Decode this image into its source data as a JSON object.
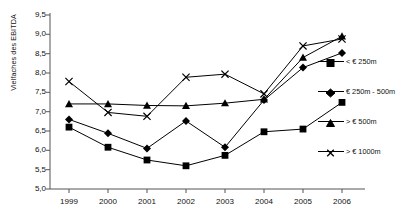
{
  "axis": {
    "ylabel": "Vielfaches des EBITDA",
    "yticks": [
      "9,5",
      "9,0",
      "8,5",
      "8,0",
      "7,5",
      "7,0",
      "6,5",
      "6,0",
      "5,5",
      "5,0"
    ],
    "xticks": [
      "1999",
      "2000",
      "2001",
      "2002",
      "2003",
      "2004",
      "2005",
      "2006"
    ]
  },
  "legend": {
    "items": [
      {
        "label": "< € 250m",
        "marker": "square-marker"
      },
      {
        "label": "€ 250m - 500m",
        "marker": "diamond-marker"
      },
      {
        "label": "> € 500m",
        "marker": "triangle-marker"
      },
      {
        "label": "> € 1000m",
        "marker": "x-marker"
      }
    ]
  },
  "chart_data": {
    "type": "line",
    "title": "",
    "xlabel": "",
    "ylabel": "Vielfaches des EBITDA",
    "categories": [
      "1999",
      "2000",
      "2001",
      "2002",
      "2003",
      "2004",
      "2005",
      "2006"
    ],
    "ylim": [
      5.0,
      9.5
    ],
    "ytick_step": 0.5,
    "grid": false,
    "legend_position": "right",
    "decimal_separator": ",",
    "series": [
      {
        "name": "< € 250m",
        "marker": "square",
        "values": [
          6.6,
          6.08,
          5.75,
          5.6,
          5.87,
          6.48,
          6.55,
          7.24
        ]
      },
      {
        "name": "€ 250m - 500m",
        "marker": "diamond",
        "values": [
          6.8,
          6.44,
          6.05,
          6.76,
          6.08,
          7.3,
          8.14,
          8.52
        ]
      },
      {
        "name": "> € 500m",
        "marker": "triangle",
        "values": [
          7.2,
          7.2,
          7.16,
          7.15,
          7.22,
          7.32,
          8.4,
          8.95
        ]
      },
      {
        "name": "> € 1000m",
        "marker": "x",
        "values": [
          7.78,
          6.98,
          6.88,
          7.89,
          7.97,
          7.46,
          8.7,
          8.88
        ]
      }
    ]
  }
}
